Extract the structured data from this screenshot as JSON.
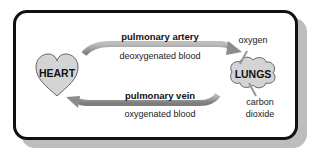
{
  "diagram": {
    "organs": {
      "heart": {
        "label": "HEART"
      },
      "lungs": {
        "label": "LUNGS"
      }
    },
    "vessels": {
      "top": {
        "name": "pulmonary artery",
        "carries": "deoxygenated blood",
        "direction": "heart-to-lungs"
      },
      "bottom": {
        "name": "pulmonary vein",
        "carries": "oxygenated blood",
        "direction": "lungs-to-heart"
      }
    },
    "gases": {
      "in": "oxygen",
      "out_line1": "carbon",
      "out_line2": "dioxide"
    },
    "colors": {
      "frame": "#111111",
      "shadow": "#bdbdbd",
      "organ_fill": "#d4d4d4",
      "arrow": "#9a9a9a"
    }
  }
}
